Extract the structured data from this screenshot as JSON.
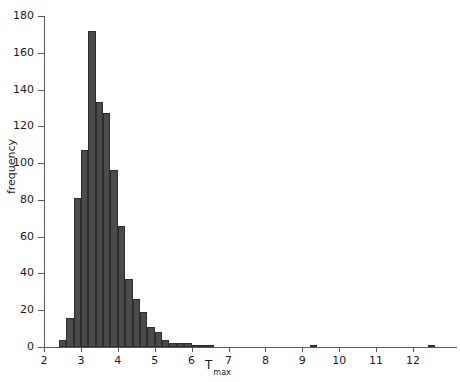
{
  "chart_data": {
    "type": "bar",
    "title": "",
    "subtitle": "",
    "xlabel": "T max",
    "xlabel_base": "T",
    "xlabel_sub": "max",
    "ylabel": "frequency",
    "xlim": [
      2,
      12.6
    ],
    "ylim": [
      0,
      180
    ],
    "grid": false,
    "legend": null,
    "bin_width": 0.2,
    "bar_color": "#4b4b4b",
    "bar_edge_color": "#2e2e2e",
    "axis_color": "#5a5a5a",
    "text_color": "#1a1a1a",
    "xticks": [
      2,
      3,
      4,
      5,
      6,
      7,
      8,
      9,
      10,
      11,
      12
    ],
    "xtick_labels": [
      "2",
      "3",
      "4",
      "5",
      "6",
      "7",
      "8",
      "9",
      "10",
      "11",
      "12"
    ],
    "yticks": [
      0,
      20,
      40,
      60,
      80,
      100,
      120,
      140,
      160,
      180
    ],
    "ytick_labels": [
      "0",
      "20",
      "40",
      "60",
      "80",
      "100",
      "120",
      "140",
      "160",
      "180"
    ],
    "bin_starts": [
      2.4,
      2.6,
      2.8,
      3.0,
      3.2,
      3.4,
      3.6,
      3.8,
      4.0,
      4.2,
      4.4,
      4.6,
      4.8,
      5.0,
      5.2,
      5.4,
      5.6,
      5.8,
      6.0,
      6.2,
      6.4,
      9.2,
      12.4
    ],
    "values": [
      4,
      16,
      81,
      107,
      172,
      133,
      127,
      96,
      66,
      37,
      26,
      19,
      11,
      8,
      4,
      2,
      2,
      2,
      1,
      1,
      1,
      1,
      1
    ],
    "categories": [
      "2.4",
      "2.6",
      "2.8",
      "3.0",
      "3.2",
      "3.4",
      "3.6",
      "3.8",
      "4.0",
      "4.2",
      "4.4",
      "4.6",
      "4.8",
      "5.0",
      "5.2",
      "5.4",
      "5.6",
      "5.8",
      "6.0",
      "6.2",
      "6.4",
      "9.2",
      "12.4"
    ]
  }
}
